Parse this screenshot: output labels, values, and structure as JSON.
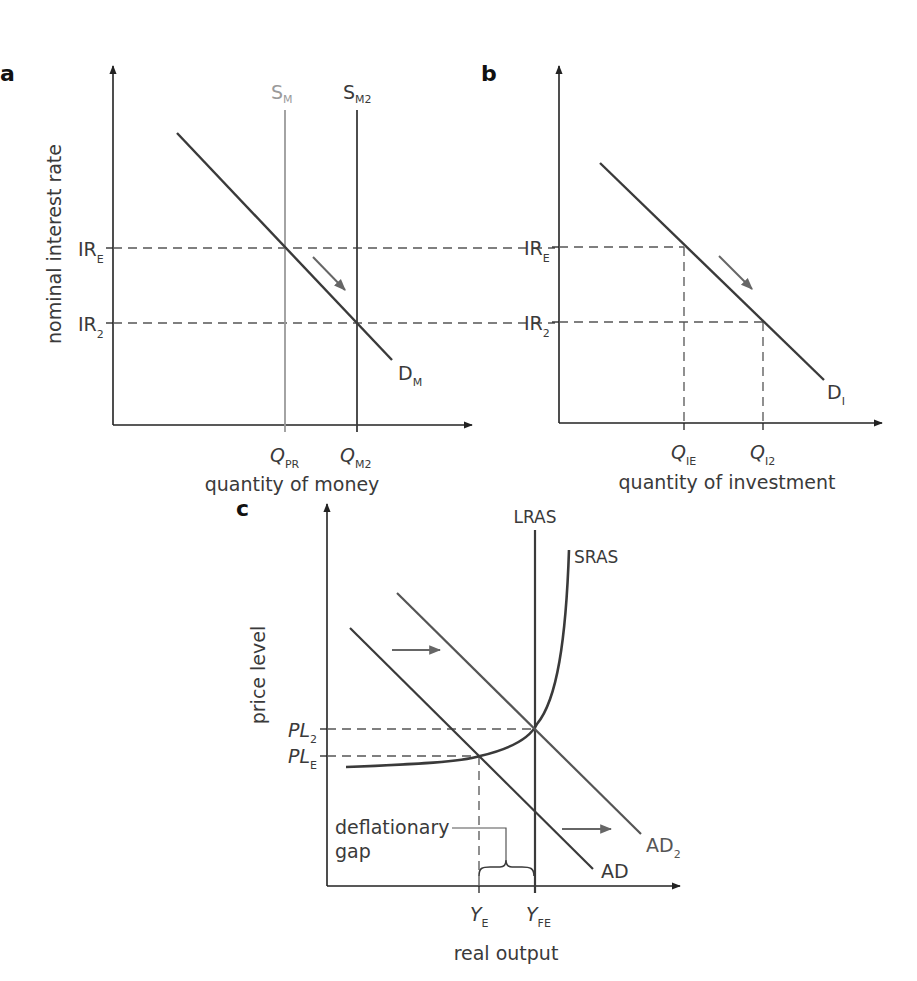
{
  "colors": {
    "axis": "#222222",
    "curve": "#3a3a3a",
    "light_curve": "#9a9a9a",
    "shifted_curve": "#555555",
    "dashed": "#555555",
    "arrow": "#666666",
    "text": "#3a3a3a"
  },
  "panels": {
    "a": {
      "letter": "a",
      "y_axis_label": "nominal interest rate",
      "x_axis_label": "quantity of money",
      "curves": {
        "supply_1": {
          "base": "S",
          "sub": "M"
        },
        "supply_2": {
          "base": "S",
          "sub": "M2"
        },
        "demand": {
          "base": "D",
          "sub": "M"
        }
      },
      "y_ticks": [
        {
          "base": "IR",
          "sub": "E"
        },
        {
          "base": "IR",
          "sub": "2"
        }
      ],
      "x_ticks": [
        {
          "base": "Q",
          "sub": "PR"
        },
        {
          "base": "Q",
          "sub": "M2"
        }
      ]
    },
    "b": {
      "letter": "b",
      "x_axis_label": "quantity of investment",
      "curves": {
        "demand": {
          "base": "D",
          "sub": "I"
        }
      },
      "y_ticks": [
        {
          "base": "IR",
          "sub": "E"
        },
        {
          "base": "IR",
          "sub": "2"
        }
      ],
      "x_ticks": [
        {
          "base": "Q",
          "sub": "IE"
        },
        {
          "base": "Q",
          "sub": "I2"
        }
      ]
    },
    "c": {
      "letter": "c",
      "y_axis_label": "price level",
      "x_axis_label": "real output",
      "curves": {
        "lras": "LRAS",
        "sras": "SRAS",
        "ad": "AD",
        "ad2": {
          "base": "AD",
          "sub": "2"
        }
      },
      "y_ticks": [
        {
          "base": "PL",
          "sub": "2"
        },
        {
          "base": "PL",
          "sub": "E"
        }
      ],
      "x_ticks": [
        {
          "base": "Y",
          "sub": "E"
        },
        {
          "base": "Y",
          "sub": "FE"
        }
      ],
      "annotation": {
        "line1": "deflationary",
        "line2": "gap"
      }
    }
  }
}
